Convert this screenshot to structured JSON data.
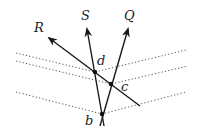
{
  "figure": {
    "type": "geometry-diagram",
    "rays": [
      {
        "label": "R",
        "from": [
          140,
          106
        ],
        "to": [
          49,
          38
        ]
      },
      {
        "label": "S",
        "from": [
          104,
          126
        ],
        "to": [
          87,
          29
        ]
      },
      {
        "label": "Q",
        "from": [
          100,
          126
        ],
        "to": [
          128,
          29
        ]
      }
    ],
    "points": [
      {
        "label": "d",
        "x": 95,
        "y": 72,
        "label_x": 97,
        "label_y": 65
      },
      {
        "label": "c",
        "x": 111,
        "y": 84,
        "label_x": 121,
        "label_y": 91
      },
      {
        "label": "b",
        "x": 102,
        "y": 114,
        "label_x": 85,
        "label_y": 125
      }
    ],
    "ray_labels": [
      {
        "text": "R",
        "x": 34,
        "y": 32
      },
      {
        "text": "S",
        "x": 81,
        "y": 20
      },
      {
        "text": "Q",
        "x": 124,
        "y": 20
      }
    ],
    "dotted_lines": [
      {
        "points": [
          [
            16,
            53
          ],
          [
            95,
            72
          ],
          [
            186,
            50
          ]
        ]
      },
      {
        "points": [
          [
            16,
            61
          ],
          [
            111,
            84
          ],
          [
            188,
            66
          ]
        ]
      },
      {
        "points": [
          [
            16,
            92
          ],
          [
            102,
            114
          ],
          [
            186,
            92
          ]
        ]
      }
    ]
  }
}
